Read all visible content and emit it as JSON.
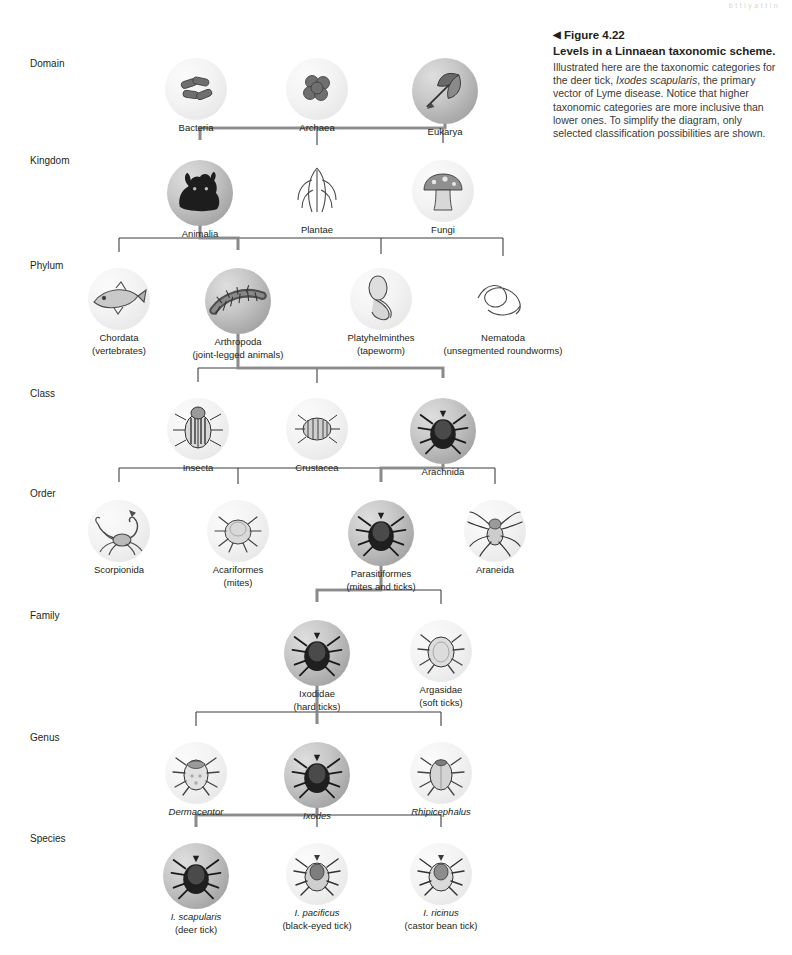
{
  "page": {
    "artifact_top_right": "b t t i  y  a t  t  i n",
    "artifact_bottom_left": "",
    "artifact_bottom_right": ""
  },
  "caption": {
    "triangle": "◀",
    "figure_number": "Figure 4.22",
    "title": "Levels in a Linnaean taxonomic scheme.",
    "body_part1": "Illustrated here are the taxonomic categories for the deer tick, ",
    "body_italic": "Ixodes scapularis",
    "body_part2": ", the primary vector of Lyme disease. Notice that higher taxonomic categories are more inclusive than lower ones. To simplify the diagram, only selected classification possibilities are shown."
  },
  "ranks": [
    {
      "label": "Domain",
      "y": 58
    },
    {
      "label": "Kingdom",
      "y": 155
    },
    {
      "label": "Phylum",
      "y": 260
    },
    {
      "label": "Class",
      "y": 388
    },
    {
      "label": "Order",
      "y": 488
    },
    {
      "label": "Family",
      "y": 610
    },
    {
      "label": "Genus",
      "y": 732
    },
    {
      "label": "Species",
      "y": 833
    }
  ],
  "levels": {
    "domain": {
      "nodes": [
        {
          "name": "Bacteria",
          "sub": "",
          "x": 196,
          "y": 58,
          "shade": "light",
          "art": "bacteria-rods",
          "italic": false
        },
        {
          "name": "Archaea",
          "sub": "",
          "x": 317,
          "y": 58,
          "shade": "light",
          "art": "archaea-cocci",
          "italic": false
        },
        {
          "name": "Eukarya",
          "sub": "",
          "x": 445,
          "y": 58,
          "shade": "dark",
          "art": "eukarya-leaf",
          "italic": false
        }
      ]
    },
    "kingdom": {
      "nodes": [
        {
          "name": "Animalia",
          "sub": "",
          "x": 200,
          "y": 160,
          "shade": "dark",
          "art": "dog",
          "italic": false
        },
        {
          "name": "Plantae",
          "sub": "",
          "x": 317,
          "y": 160,
          "shade": "none",
          "art": "corn",
          "italic": false
        },
        {
          "name": "Fungi",
          "sub": "",
          "x": 443,
          "y": 160,
          "shade": "light",
          "art": "mushroom",
          "italic": false
        }
      ]
    },
    "phylum": {
      "nodes": [
        {
          "name": "Chordata",
          "sub": "(vertebrates)",
          "x": 119,
          "y": 268,
          "shade": "light",
          "art": "fish",
          "italic": false
        },
        {
          "name": "Arthropoda",
          "sub": "(joint-legged animals)",
          "x": 238,
          "y": 268,
          "shade": "dark",
          "art": "centipede",
          "italic": false
        },
        {
          "name": "Platyhelminthes",
          "sub": "(tapeworm)",
          "x": 381,
          "y": 268,
          "shade": "light",
          "art": "tapeworm",
          "italic": false
        },
        {
          "name": "Nematoda",
          "sub": "(unsegmented roundworms)",
          "x": 503,
          "y": 268,
          "shade": "none",
          "art": "roundworm",
          "italic": false
        }
      ]
    },
    "class": {
      "nodes": [
        {
          "name": "Insecta",
          "sub": "",
          "x": 198,
          "y": 398,
          "shade": "light",
          "art": "beetle",
          "italic": false
        },
        {
          "name": "Crustacea",
          "sub": "",
          "x": 317,
          "y": 398,
          "shade": "light",
          "art": "isopod",
          "italic": false
        },
        {
          "name": "Arachnida",
          "sub": "",
          "x": 443,
          "y": 398,
          "shade": "dark",
          "art": "tick",
          "italic": false
        }
      ]
    },
    "order": {
      "nodes": [
        {
          "name": "Scorpionida",
          "sub": "",
          "x": 119,
          "y": 500,
          "shade": "light",
          "art": "scorpion",
          "italic": false
        },
        {
          "name": "Acariformes",
          "sub": "(mites)",
          "x": 238,
          "y": 500,
          "shade": "light",
          "art": "mite",
          "italic": false
        },
        {
          "name": "Parasitiformes",
          "sub": "(mites and ticks)",
          "x": 381,
          "y": 500,
          "shade": "dark",
          "art": "tick",
          "italic": false
        },
        {
          "name": "Araneida",
          "sub": "",
          "x": 495,
          "y": 500,
          "shade": "light",
          "art": "spider",
          "italic": false
        }
      ]
    },
    "family": {
      "nodes": [
        {
          "name": "Ixodidae",
          "sub": "(hard ticks)",
          "x": 317,
          "y": 620,
          "shade": "dark",
          "art": "tick",
          "italic": false
        },
        {
          "name": "Argasidae",
          "sub": "(soft ticks)",
          "x": 441,
          "y": 620,
          "shade": "light",
          "art": "softtick",
          "italic": false
        }
      ]
    },
    "genus": {
      "nodes": [
        {
          "name": "Dermacentor",
          "sub": "",
          "x": 196,
          "y": 742,
          "shade": "light",
          "art": "dermacentor",
          "italic": true
        },
        {
          "name": "Ixodes",
          "sub": "",
          "x": 317,
          "y": 742,
          "shade": "dark",
          "art": "tick",
          "italic": true
        },
        {
          "name": "Rhipicephalus",
          "sub": "",
          "x": 441,
          "y": 742,
          "shade": "light",
          "art": "rhipicephalus",
          "italic": true
        }
      ]
    },
    "species": {
      "nodes": [
        {
          "name": "I. scapularis",
          "sub": "(deer tick)",
          "x": 196,
          "y": 843,
          "shade": "dark",
          "art": "tick",
          "italic": true
        },
        {
          "name": "I. pacificus",
          "sub": "(black-eyed tick)",
          "x": 317,
          "y": 843,
          "shade": "light",
          "art": "tick2",
          "italic": true
        },
        {
          "name": "I. ricinus",
          "sub": "(castor bean tick)",
          "x": 441,
          "y": 843,
          "shade": "light",
          "art": "tick3",
          "italic": true
        }
      ]
    }
  }
}
